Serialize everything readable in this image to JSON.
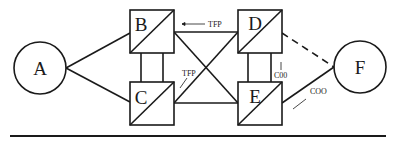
{
  "diagram": {
    "nodes": [
      {
        "id": "A",
        "label": "A",
        "shape": "circle",
        "cx": 40,
        "cy": 68,
        "r": 26
      },
      {
        "id": "B",
        "label": "B",
        "shape": "split-square",
        "x": 130,
        "y": 10,
        "w": 44,
        "h": 43
      },
      {
        "id": "C",
        "label": "C",
        "shape": "split-square",
        "x": 130,
        "y": 82,
        "w": 44,
        "h": 43
      },
      {
        "id": "D",
        "label": "D",
        "shape": "split-square",
        "x": 238,
        "y": 10,
        "w": 44,
        "h": 43
      },
      {
        "id": "E",
        "label": "E",
        "shape": "split-square",
        "x": 238,
        "y": 82,
        "w": 44,
        "h": 43
      },
      {
        "id": "F",
        "label": "F",
        "shape": "circle",
        "cx": 360,
        "cy": 67,
        "r": 26
      }
    ],
    "edges": [
      {
        "from": "A",
        "to": "B",
        "style": "solid"
      },
      {
        "from": "A",
        "to": "C",
        "style": "solid"
      },
      {
        "from": "B",
        "to": "C",
        "style": "double-vertical"
      },
      {
        "from": "D",
        "to": "E",
        "style": "double-vertical"
      },
      {
        "from": "B",
        "to": "D",
        "style": "solid"
      },
      {
        "from": "C",
        "to": "E",
        "style": "solid"
      },
      {
        "from": "B",
        "to": "E",
        "style": "solid"
      },
      {
        "from": "D",
        "to": "C",
        "style": "solid"
      },
      {
        "from": "D",
        "to": "F",
        "style": "dashed"
      },
      {
        "from": "E",
        "to": "F",
        "style": "solid"
      }
    ],
    "annotations": [
      {
        "text": "TFP",
        "note": "arrow pointing left along B–D edge"
      },
      {
        "text": "TFP",
        "note": "arrow pointing down-left along D–C diagonal"
      },
      {
        "text": "C00",
        "note": "arrow pointing up between D and E"
      },
      {
        "text": "COO",
        "note": "arrow pointing down-left along E–F edge"
      }
    ],
    "colors": {
      "stroke": "#1a1a1a",
      "background": "#ffffff"
    }
  }
}
